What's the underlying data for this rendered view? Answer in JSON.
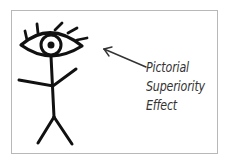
{
  "diagram": {
    "label_lines": [
      "Pictorial",
      "Superiority",
      "Effect"
    ],
    "figure": "stick-figure-with-eye-head",
    "arrow": "points-from-label-to-eye",
    "colors": {
      "ink": "#111111",
      "label": "#333333",
      "border": "#b8b8b8",
      "background": "#ffffff"
    }
  }
}
